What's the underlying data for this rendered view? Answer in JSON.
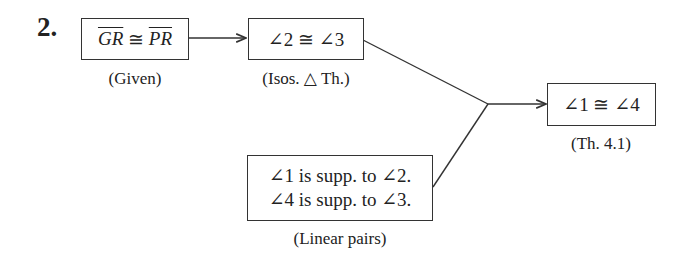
{
  "problem_number": "2.",
  "nodes": [
    {
      "id": "given",
      "statement_parts": {
        "seg1": "GR",
        "op": " ≅ ",
        "seg2": "PR"
      },
      "reason": "(Given)"
    },
    {
      "id": "angles23",
      "statement": "∠2 ≅ ∠3",
      "reason": "(Isos. △ Th.)"
    },
    {
      "id": "conclusion",
      "statement": "∠1 ≅ ∠4",
      "reason": "(Th. 4.1)"
    },
    {
      "id": "linear",
      "statement_lines": [
        "∠1 is supp. to ∠2.",
        "∠4 is supp. to ∠3."
      ],
      "reason": "(Linear pairs)"
    }
  ],
  "edges": [
    {
      "from": "given",
      "to": "angles23",
      "type": "arrow"
    },
    {
      "from": "angles23",
      "to": "conclusion",
      "type": "merge-arrow"
    },
    {
      "from": "linear",
      "to": "conclusion",
      "type": "merge-arrow"
    }
  ],
  "colors": {
    "line": "#333333",
    "text": "#222222"
  }
}
